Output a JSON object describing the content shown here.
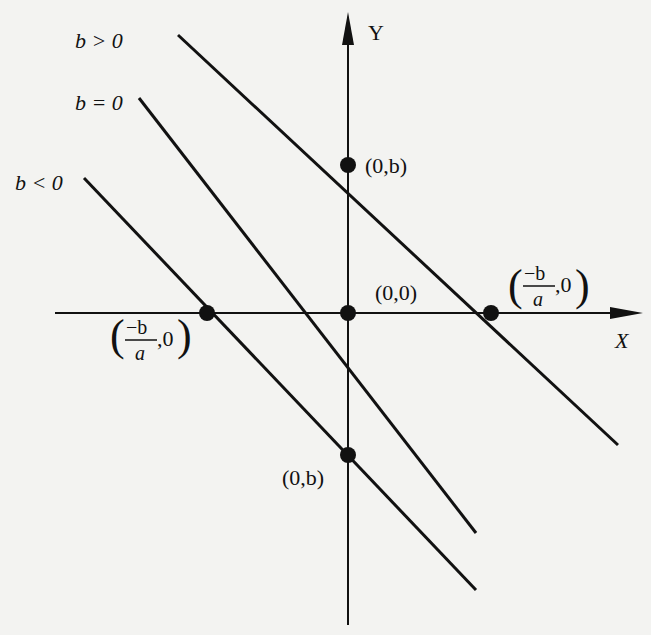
{
  "colors": {
    "background": "#f3f3f1",
    "ink": "#111111"
  },
  "axes": {
    "y_label": "Y",
    "x_label": "X",
    "origin_px": [
      348,
      313
    ],
    "y_axis": {
      "x": 348,
      "y_top": 12,
      "y_bottom": 625
    },
    "x_axis": {
      "y": 313,
      "x_left": 55,
      "x_right": 643
    }
  },
  "lines": [
    {
      "id": "b-positive",
      "label": "b > 0",
      "label_pos": [
        75,
        48
      ],
      "from": [
        178,
        35
      ],
      "to": [
        618,
        445
      ]
    },
    {
      "id": "b-zero",
      "label": "b = 0",
      "label_pos": [
        75,
        110
      ],
      "from": [
        139,
        98
      ],
      "to": [
        476,
        533
      ]
    },
    {
      "id": "b-negative",
      "label": "b < 0",
      "label_pos": [
        15,
        190
      ],
      "from": [
        84,
        178
      ],
      "to": [
        476,
        590
      ]
    }
  ],
  "points": [
    {
      "id": "y-intercept-positive",
      "at": [
        348,
        165
      ],
      "label": "(0,b)"
    },
    {
      "id": "origin",
      "at": [
        348,
        313
      ],
      "label": "(0,0)"
    },
    {
      "id": "x-intercept-positive",
      "at": [
        491,
        313
      ],
      "label_num": "−b",
      "label_den": "a",
      "label_rest": ",0"
    },
    {
      "id": "x-intercept-negative",
      "at": [
        207,
        313
      ],
      "label_num": "−b",
      "label_den": "a",
      "label_rest": ",0"
    },
    {
      "id": "y-intercept-negative",
      "at": [
        348,
        455
      ],
      "label": "(0,b)"
    }
  ]
}
